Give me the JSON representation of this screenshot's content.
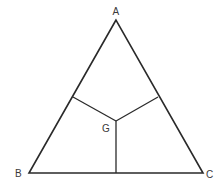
{
  "diagram": {
    "type": "geometry",
    "colors": {
      "stroke": "#2a2a2a",
      "label": "#3a3a3a",
      "background": "#ffffff"
    },
    "points": {
      "A": {
        "label": "A",
        "x": 116,
        "y": 20
      },
      "B": {
        "label": "B",
        "x": 29,
        "y": 173
      },
      "C": {
        "label": "C",
        "x": 203,
        "y": 173
      },
      "G": {
        "label": "G",
        "x": 116,
        "y": 121
      },
      "P_AB": {
        "label": "",
        "x": 73,
        "y": 97
      },
      "P_AC": {
        "label": "",
        "x": 158,
        "y": 97
      },
      "P_BC": {
        "label": "",
        "x": 116,
        "y": 173
      }
    },
    "labels": {
      "A": "A",
      "B": "B",
      "C": "C",
      "G": "G"
    },
    "segments": [
      {
        "from": "A",
        "to": "B"
      },
      {
        "from": "B",
        "to": "C"
      },
      {
        "from": "C",
        "to": "A"
      },
      {
        "from": "G",
        "to": "P_AB"
      },
      {
        "from": "G",
        "to": "P_AC"
      },
      {
        "from": "G",
        "to": "P_BC"
      }
    ]
  }
}
